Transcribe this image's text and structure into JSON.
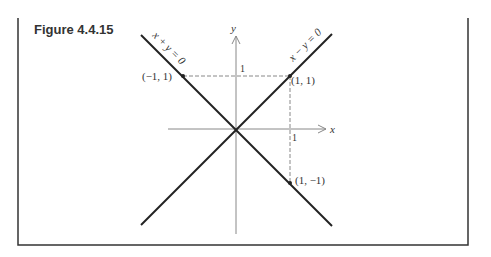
{
  "caption": "Figure 4.4.15",
  "axes": {
    "x_label": "x",
    "y_label": "y",
    "x_tick": "1",
    "y_tick": "1"
  },
  "lines": [
    {
      "label": "x + y = 0",
      "slope": -1
    },
    {
      "label": "x − y = 0",
      "slope": 1
    }
  ],
  "points": [
    {
      "label": "(−1, 1)",
      "x": -1,
      "y": 1
    },
    {
      "label": "(1, 1)",
      "x": 1,
      "y": 1
    },
    {
      "label": "(1, −1)",
      "x": 1,
      "y": -1
    }
  ],
  "colors": {
    "ink": "#222222",
    "axis": "#888888",
    "frame": "#333333"
  }
}
